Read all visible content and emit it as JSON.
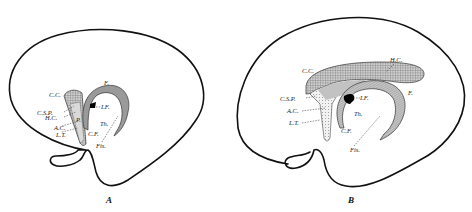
{
  "figure": {
    "panels": [
      {
        "id": "A",
        "caption": "A",
        "labels": {
          "cc": "C.C.",
          "csp": "C.S.P.",
          "hc": "H.C.",
          "ac": "A.C.",
          "lt": "L.T.",
          "p": "P.",
          "f": "F.",
          "if": "I.F.",
          "th": "Th.",
          "cf": "C.F.",
          "fis": "Fis."
        }
      },
      {
        "id": "B",
        "caption": "B",
        "labels": {
          "cc": "C.C.",
          "hc": "H.C.",
          "csp": "C.S.P.",
          "if": "I.F.",
          "f": "F.",
          "ac": "A.C.",
          "th": "Th.",
          "lt": "L.T.",
          "cf": "C.F.",
          "fis": "Fis."
        }
      }
    ],
    "colors": {
      "line": "#111111",
      "shade_dark": "#8a8a8a",
      "shade_mid": "#b5b5b5",
      "shade_light": "#d6d6d6",
      "foramen": "#000000"
    }
  }
}
